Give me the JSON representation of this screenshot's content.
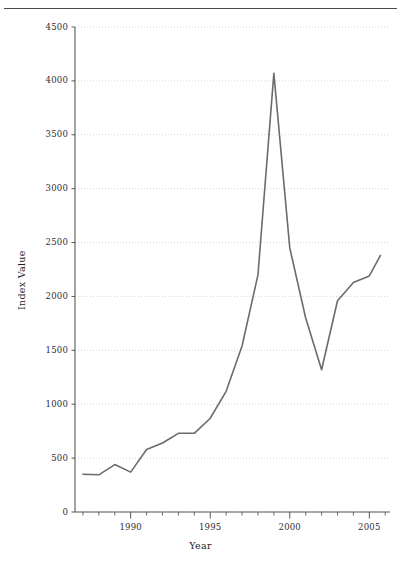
{
  "figure": {
    "has_top_rule": true,
    "title_cutoff_hint": "",
    "background_color": "#ffffff",
    "line_color": "#6b6b6b",
    "grid_color": "#c9c9d4",
    "axis_color": "#585858"
  },
  "axes": {
    "y_title": "Index Value",
    "x_title": "Year",
    "y_tick_labels": [
      "4500",
      "4000",
      "3500",
      "3000",
      "2500",
      "2000",
      "1500",
      "1000",
      "500",
      "0"
    ],
    "x_tick_labels": [
      "1990",
      "1995",
      "2000",
      "2005"
    ]
  },
  "chart_data": {
    "type": "line",
    "title": "",
    "xlabel": "Year",
    "ylabel": "Index Value",
    "xlim": [
      1986.5,
      2006.3
    ],
    "ylim": [
      0,
      4500
    ],
    "yticks": [
      0,
      500,
      1000,
      1500,
      2000,
      2500,
      3000,
      3500,
      4000,
      4500
    ],
    "xticks": [
      1990,
      1995,
      2000,
      2005
    ],
    "xticks_minor": [
      1987,
      1988,
      1989,
      1991,
      1992,
      1993,
      1994,
      1996,
      1997,
      1998,
      1999,
      2001,
      2002,
      2003,
      2004,
      2006
    ],
    "grid": true,
    "grid_axis": "y",
    "legend": false,
    "series": [
      {
        "name": "Index Value",
        "color": "#6b6b6b",
        "x": [
          1987,
          1988,
          1989,
          1990,
          1991,
          1992,
          1993,
          1994,
          1995,
          1996,
          1997,
          1998,
          1999,
          2000,
          2001,
          2002,
          2003,
          2004,
          2005,
          2005.7
        ],
        "values": [
          350,
          345,
          440,
          370,
          580,
          640,
          730,
          730,
          870,
          1120,
          1540,
          2200,
          4070,
          2450,
          1800,
          1320,
          1960,
          2130,
          2190,
          2380
        ]
      }
    ]
  }
}
